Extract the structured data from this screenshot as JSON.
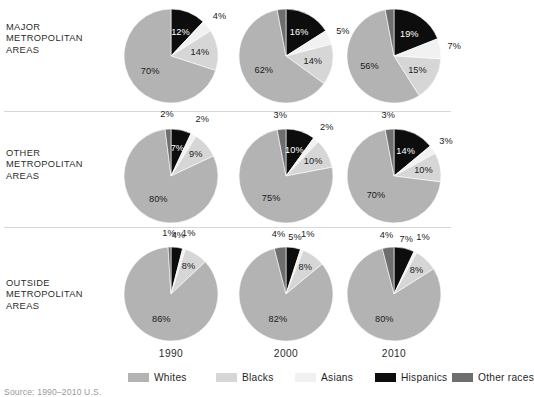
{
  "figure": {
    "source_note": "Source: 1990–2010 U.S.",
    "row_labels": [
      "MAJOR\nMETROPOLITAN\nAREAS",
      "OTHER\nMETROPOLITAN\nAREAS",
      "OUTSIDE\nMETROPOLITAN\nAREAS"
    ],
    "year_labels": [
      "1990",
      "2000",
      "2010"
    ]
  },
  "legend": {
    "items": [
      {
        "label": "Whites",
        "color": "#b3b3b3"
      },
      {
        "label": "Blacks",
        "color": "#d6d6d6"
      },
      {
        "label": "Asians",
        "color": "#f1f1f1"
      },
      {
        "label": "Hispanics",
        "color": "#0d0d0d"
      },
      {
        "label": "Other races",
        "color": "#6e6e6e"
      }
    ]
  },
  "chart_data": {
    "type": "pie",
    "title": "",
    "legend_position": "bottom",
    "categories": [
      "Whites",
      "Blacks",
      "Asians",
      "Hispanics",
      "Other races"
    ],
    "colors": [
      "#b3b3b3",
      "#d6d6d6",
      "#f1f1f1",
      "#0d0d0d",
      "#6e6e6e"
    ],
    "rows": [
      "MAJOR METROPOLITAN AREAS",
      "OTHER METROPOLITAN AREAS",
      "OUTSIDE METROPOLITAN AREAS"
    ],
    "columns": [
      "1990",
      "2000",
      "2010"
    ],
    "panels": [
      {
        "row": "MAJOR METROPOLITAN AREAS",
        "column": "1990",
        "values": {
          "Whites": 70,
          "Blacks": 14,
          "Asians": 4,
          "Hispanics": 12,
          "Other races": 0
        },
        "labels": {
          "Whites": "70%",
          "Blacks": "14%",
          "Asians": "4%",
          "Hispanics": "12%",
          "Other races": ""
        }
      },
      {
        "row": "MAJOR METROPOLITAN AREAS",
        "column": "2000",
        "values": {
          "Whites": 62,
          "Blacks": 14,
          "Asians": 5,
          "Hispanics": 16,
          "Other races": 3
        },
        "labels": {
          "Whites": "62%",
          "Blacks": "14%",
          "Asians": "5%",
          "Hispanics": "16%",
          "Other races": "3%"
        }
      },
      {
        "row": "MAJOR METROPOLITAN AREAS",
        "column": "2010",
        "values": {
          "Whites": 56,
          "Blacks": 15,
          "Asians": 7,
          "Hispanics": 19,
          "Other races": 3
        },
        "labels": {
          "Whites": "56%",
          "Blacks": "15%",
          "Asians": "7%",
          "Hispanics": "19%",
          "Other races": "3%"
        }
      },
      {
        "row": "OTHER METROPOLITAN AREAS",
        "column": "1990",
        "values": {
          "Whites": 80,
          "Blacks": 9,
          "Asians": 2,
          "Hispanics": 7,
          "Other races": 2
        },
        "labels": {
          "Whites": "80%",
          "Blacks": "9%",
          "Asians": "2%",
          "Hispanics": "7%",
          "Other races": "2%"
        }
      },
      {
        "row": "OTHER METROPOLITAN AREAS",
        "column": "2000",
        "values": {
          "Whites": 75,
          "Blacks": 10,
          "Asians": 2,
          "Hispanics": 10,
          "Other races": 3
        },
        "labels": {
          "Whites": "75%",
          "Blacks": "10%",
          "Asians": "2%",
          "Hispanics": "10%",
          "Other races": "3%"
        }
      },
      {
        "row": "OTHER METROPOLITAN AREAS",
        "column": "2010",
        "values": {
          "Whites": 70,
          "Blacks": 10,
          "Asians": 3,
          "Hispanics": 14,
          "Other races": 3
        },
        "labels": {
          "Whites": "70%",
          "Blacks": "10%",
          "Asians": "3%",
          "Hispanics": "14%",
          "Other races": "3%"
        }
      },
      {
        "row": "OUTSIDE METROPOLITAN AREAS",
        "column": "1990",
        "values": {
          "Whites": 86,
          "Blacks": 8,
          "Asians": 1,
          "Hispanics": 4,
          "Other races": 1
        },
        "labels": {
          "Whites": "86%",
          "Blacks": "8%",
          "Asians": "1%",
          "Hispanics": "4%",
          "Other races": "1%"
        }
      },
      {
        "row": "OUTSIDE METROPOLITAN AREAS",
        "column": "2000",
        "values": {
          "Whites": 82,
          "Blacks": 8,
          "Asians": 1,
          "Hispanics": 5,
          "Other races": 4
        },
        "labels": {
          "Whites": "82%",
          "Blacks": "8%",
          "Asians": "1%",
          "Hispanics": "5%",
          "Other races": "4%"
        }
      },
      {
        "row": "OUTSIDE METROPOLITAN AREAS",
        "column": "2010",
        "values": {
          "Whites": 80,
          "Blacks": 8,
          "Asians": 1,
          "Hispanics": 7,
          "Other races": 4
        },
        "labels": {
          "Whites": "80%",
          "Blacks": "8%",
          "Asians": "1%",
          "Hispanics": "7%",
          "Other races": "4%"
        }
      }
    ]
  }
}
